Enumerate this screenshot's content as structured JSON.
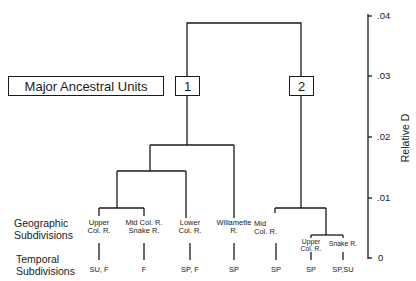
{
  "diagram": {
    "type": "dendrogram",
    "header_box": "Major Ancestral Units",
    "units": [
      {
        "id": "1",
        "label": "1"
      },
      {
        "id": "2",
        "label": "2"
      }
    ],
    "row_labels": {
      "geographic": "Geographic\nSubdivisions",
      "temporal": "Temporal\nSubdivisions"
    },
    "leaves": [
      {
        "unit": "1",
        "geographic": "Upper\nCol. R.",
        "temporal": "SU, F"
      },
      {
        "unit": "1",
        "geographic": "Mid Col. R.\nSnake R.",
        "temporal": "F"
      },
      {
        "unit": "1",
        "geographic": "Lower\nCol. R.",
        "temporal": "SP, F"
      },
      {
        "unit": "1",
        "geographic": "Willamette\nR.",
        "temporal": "SP"
      },
      {
        "unit": "2",
        "geographic": "Mid\nCol. R.",
        "temporal": "SP"
      },
      {
        "unit": "2",
        "geographic": "Upper\nCol. R.",
        "temporal": "SP"
      },
      {
        "unit": "2",
        "geographic": "Snake R.",
        "temporal": "SP,SU"
      }
    ],
    "axis": {
      "title": "Relative D",
      "ticks": [
        ".04",
        ".03",
        ".02",
        ".01",
        "0"
      ],
      "range": [
        0,
        0.04
      ]
    },
    "joins": [
      {
        "members": [
          "Upper Col. R. (1)",
          "Mid Col. R./Snake R. (1)"
        ],
        "height": 0.0083
      },
      {
        "members": [
          "cluster",
          "Lower Col. R. (1)"
        ],
        "height": 0.0143
      },
      {
        "members": [
          "cluster",
          "Willamette R. (1)"
        ],
        "height": 0.0186
      },
      {
        "members": [
          "Upper Col. R. (2)",
          "Snake R. (2)"
        ],
        "height": 0.0038
      },
      {
        "members": [
          "Mid Col. R. (2)",
          "cluster"
        ],
        "height": 0.0083
      },
      {
        "members": [
          "Unit 1",
          "Unit 2"
        ],
        "height": 0.039
      }
    ]
  }
}
